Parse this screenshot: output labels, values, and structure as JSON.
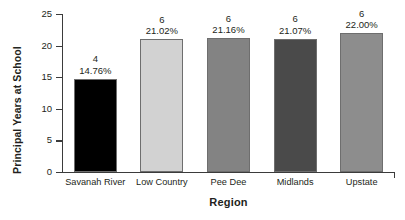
{
  "chart_data": {
    "type": "bar",
    "title": "",
    "xlabel": "Region",
    "ylabel": "Principal Years at School",
    "categories": [
      "Savanah River",
      "Low Country",
      "Pee Dee",
      "Midlands",
      "Upstate"
    ],
    "values": [
      14.76,
      21.02,
      21.16,
      21.07,
      22.0
    ],
    "counts": [
      "4",
      "6",
      "6",
      "6",
      "6"
    ],
    "percent_labels": [
      "14.76%",
      "21.02%",
      "21.16%",
      "21.07%",
      "22.00%"
    ],
    "bar_colors": [
      "#000000",
      "#d2d2d2",
      "#838383",
      "#4a4a4a",
      "#8d8d8d"
    ],
    "bar_border_color": "#6e6e6e",
    "ylim": [
      0,
      25
    ],
    "yticks": [
      "0",
      "5",
      "10",
      "15",
      "20",
      "25"
    ],
    "ytick_values": [
      0,
      5,
      10,
      15,
      20,
      25
    ],
    "grid": false,
    "legend": "none",
    "axis_color": "#3b3b3b",
    "text_color": "#231f20",
    "background": "#ffffff"
  }
}
